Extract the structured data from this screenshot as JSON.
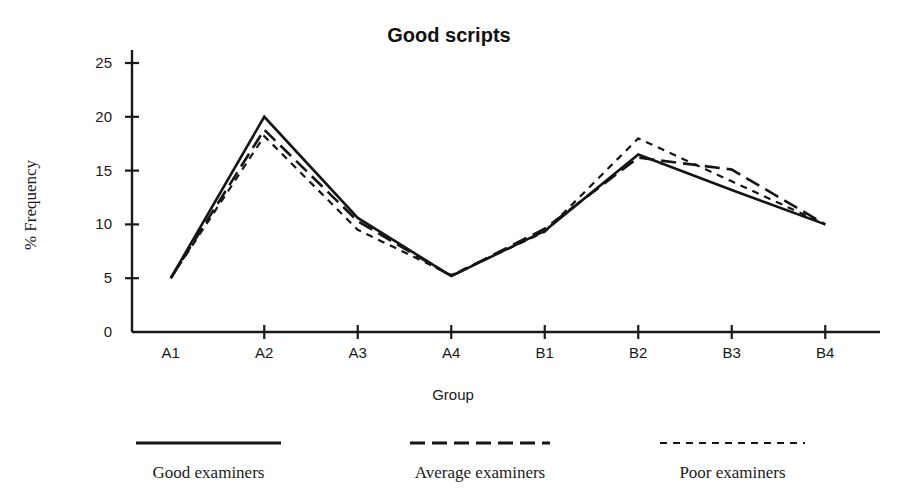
{
  "chart_data": {
    "type": "line",
    "title": "Good scripts",
    "xlabel": "Group",
    "ylabel": "% Frequency",
    "categories": [
      "A1",
      "A2",
      "A3",
      "A4",
      "B1",
      "B2",
      "B3",
      "B4"
    ],
    "yticks": [
      0,
      5,
      10,
      15,
      20,
      25
    ],
    "ylim": [
      0,
      27
    ],
    "grid": false,
    "legend_position": "bottom",
    "series": [
      {
        "name": "Good examiners",
        "style": "solid",
        "values": [
          5.0,
          20.0,
          10.6,
          5.2,
          9.4,
          16.5,
          13.2,
          10.0
        ]
      },
      {
        "name": "Average examiners",
        "style": "long-dash",
        "values": [
          5.0,
          18.8,
          10.3,
          5.2,
          9.6,
          16.2,
          15.1,
          10.0
        ]
      },
      {
        "name": "Poor examiners",
        "style": "short-dash",
        "values": [
          5.0,
          18.2,
          9.5,
          5.3,
          9.3,
          18.0,
          14.0,
          10.0
        ]
      }
    ]
  },
  "legend": {
    "items": [
      {
        "label": "Good examiners",
        "style": "solid"
      },
      {
        "label": "Average examiners",
        "style": "long-dash"
      },
      {
        "label": "Poor examiners",
        "style": "short-dash"
      }
    ]
  }
}
